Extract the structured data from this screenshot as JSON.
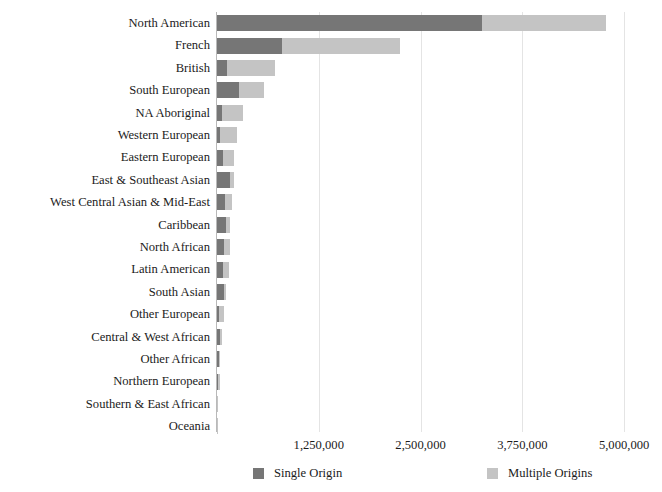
{
  "chart_data": {
    "type": "bar",
    "orientation": "horizontal",
    "stacked": true,
    "title": "",
    "subtitle": "",
    "xlabel": "",
    "ylabel": "",
    "xlim": [
      0,
      5220000
    ],
    "xticks": [
      1250000,
      2500000,
      3750000,
      5000000
    ],
    "xtick_labels": [
      "1,250,000",
      "2,500,000",
      "3,750,000",
      "5,000,000"
    ],
    "grid": true,
    "legend_position": "bottom",
    "categories": [
      "North American",
      "French",
      "British",
      "South European",
      "NA Aboriginal",
      "Western European",
      "Eastern European",
      "East & Southeast Asian",
      "West Central Asian & Mid-East",
      "Caribbean",
      "North African",
      "Latin American",
      "South Asian",
      "Other European",
      "Central & West African",
      "Other African",
      "Northern European",
      "Southern & East African",
      "Oceania"
    ],
    "series": [
      {
        "name": "Single Origin",
        "color": "#767676",
        "values": [
          3250000,
          800000,
          120000,
          270000,
          60000,
          40000,
          75000,
          165000,
          95000,
          110000,
          85000,
          70000,
          90000,
          30000,
          40000,
          27000,
          12000,
          5000,
          2000
        ]
      },
      {
        "name": "Multiple Origins",
        "color": "#c4c4c4",
        "values": [
          1530000,
          1450000,
          590000,
          310000,
          260000,
          200000,
          135000,
          50000,
          95000,
          55000,
          80000,
          75000,
          20000,
          55000,
          25000,
          13000,
          22000,
          6000,
          3000
        ]
      }
    ]
  },
  "legend": {
    "items": [
      {
        "label": "Single Origin",
        "color": "#767676"
      },
      {
        "label": "Multiple Origins",
        "color": "#c4c4c4"
      }
    ]
  },
  "icons": {
    "single_origin_swatch": "square-swatch-icon",
    "multiple_origins_swatch": "square-swatch-icon"
  }
}
